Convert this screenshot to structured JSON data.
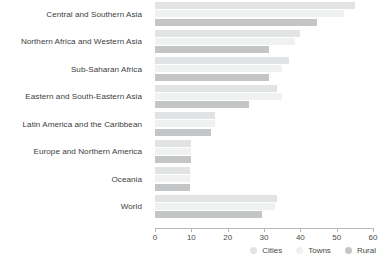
{
  "chart_data": {
    "type": "bar",
    "orientation": "horizontal",
    "title": "",
    "xlabel": "",
    "ylabel": "",
    "xlim": [
      0,
      60
    ],
    "xticks": [
      0,
      10,
      20,
      30,
      40,
      50,
      60
    ],
    "xtick_labels": [
      "0",
      "10",
      "20",
      "30",
      "40",
      "50",
      "60"
    ],
    "grid": false,
    "legend_position": "bottom-right",
    "categories": [
      "Central and Southern Asia",
      "Northern Africa and Western Asia",
      "Sub-Saharan Africa",
      "Eastern and South-Eastern Asia",
      "Latin America and the Caribbean",
      "Europe and Northern America",
      "Oceania",
      "World"
    ],
    "series": [
      {
        "name": "Cities",
        "color": "#e2e3e4",
        "values": [
          55,
          40,
          37,
          33.5,
          16.5,
          10,
          9.5,
          33.5
        ]
      },
      {
        "name": "Towns",
        "color": "#f0f1f1",
        "values": [
          52,
          38.5,
          35,
          35,
          16.5,
          10,
          9.5,
          33
        ]
      },
      {
        "name": "Rural",
        "color": "#c3c5c6",
        "values": [
          44.5,
          31.5,
          31.5,
          26,
          15.5,
          10,
          9.5,
          29.5
        ]
      }
    ]
  },
  "legend": {
    "items": [
      {
        "label": "Cities",
        "color": "#e2e3e4"
      },
      {
        "label": "Towns",
        "color": "#f0f1f1"
      },
      {
        "label": "Rural",
        "color": "#c3c5c6"
      }
    ]
  }
}
